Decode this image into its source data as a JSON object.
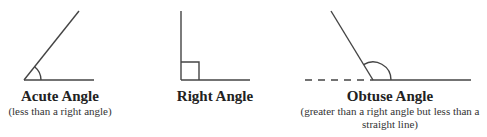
{
  "diagram": {
    "line_color": "#444444",
    "background": "#ffffff",
    "angles": [
      {
        "id": "acute",
        "title": "Acute Angle",
        "subtitle": "(less than a right angle)",
        "vertex": [
          24,
          80
        ],
        "ray_end": [
          79,
          11
        ],
        "base_end": [
          94,
          80
        ]
      },
      {
        "id": "right",
        "title": "Right Angle",
        "subtitle": "",
        "vertex": [
          181,
          80
        ],
        "ray_end": [
          181,
          11
        ],
        "base_end": [
          250,
          80
        ],
        "square_size": 18
      },
      {
        "id": "obtuse",
        "title": "Obtuse Angle",
        "subtitle": "(greater than a right angle but less than a straight line)",
        "vertex": [
          373,
          80
        ],
        "ray_end": [
          331,
          11
        ],
        "base_end": [
          471,
          80
        ],
        "dashed_start": [
          305,
          80
        ]
      }
    ]
  }
}
